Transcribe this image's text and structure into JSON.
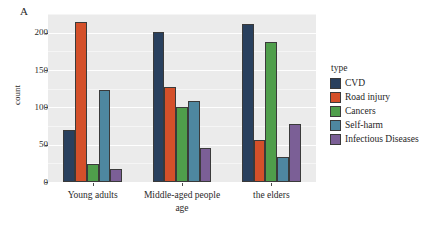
{
  "panel_label": "A",
  "legend": {
    "title": "type",
    "items": [
      {
        "label": "CVD",
        "color": "#29405e"
      },
      {
        "label": "Road injury",
        "color": "#d4502a"
      },
      {
        "label": "Cancers",
        "color": "#4f9e4b"
      },
      {
        "label": "Self-harm",
        "color": "#4e87a0"
      },
      {
        "label": "Infectious Diseases",
        "color": "#7b5f96"
      }
    ]
  },
  "axes": {
    "ylabel": "count",
    "xlabel": "age",
    "yticks": [
      0,
      50,
      100,
      150,
      200
    ],
    "ytick_labels": [
      "0",
      "50",
      "100",
      "150",
      "200"
    ],
    "ylim": [
      0,
      225
    ]
  },
  "chart_data": {
    "type": "bar",
    "title": "A",
    "xlabel": "age",
    "ylabel": "count",
    "categories": [
      "Young adults",
      "Middle-aged people",
      "the elders"
    ],
    "series": [
      {
        "name": "CVD",
        "color": "#29405e",
        "values": [
          69,
          201,
          211
        ]
      },
      {
        "name": "Road injury",
        "color": "#d4502a",
        "values": [
          214,
          127,
          56
        ]
      },
      {
        "name": "Cancers",
        "color": "#4f9e4b",
        "values": [
          24,
          101,
          188
        ]
      },
      {
        "name": "Self-harm",
        "color": "#4e87a0",
        "values": [
          123,
          108,
          33
        ]
      },
      {
        "name": "Infectious Diseases",
        "color": "#7b5f96",
        "values": [
          17,
          45,
          78
        ]
      }
    ],
    "ylim": [
      0,
      225
    ],
    "yticks": [
      0,
      50,
      100,
      150,
      200
    ],
    "grid": true,
    "legend_position": "right",
    "legend_title": "type"
  }
}
